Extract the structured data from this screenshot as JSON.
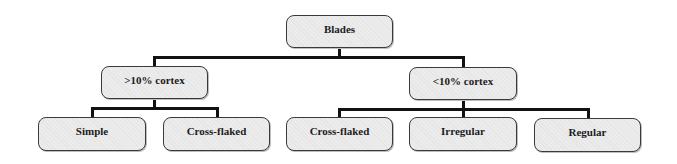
{
  "diagram": {
    "type": "tree",
    "root": {
      "label": "Blades",
      "children": [
        {
          "label": ">10% cortex",
          "children": [
            {
              "label": "Simple"
            },
            {
              "label": "Cross-flaked"
            }
          ]
        },
        {
          "label": "<10% cortex",
          "children": [
            {
              "label": "Cross-flaked"
            },
            {
              "label": "Irregular"
            },
            {
              "label": "Regular"
            }
          ]
        }
      ]
    },
    "colors": {
      "node_fill": "#ececec",
      "node_border": "#3a3a3a",
      "connector": "#111111",
      "text": "#1c1c1c"
    }
  },
  "nodes": {
    "root": "Blades",
    "gt10": ">10% cortex",
    "lt10": "<10% cortex",
    "gt10_simple": "Simple",
    "gt10_crossflaked": "Cross-flaked",
    "lt10_crossflaked": "Cross-flaked",
    "lt10_irregular": "Irregular",
    "lt10_regular": "Regular"
  }
}
